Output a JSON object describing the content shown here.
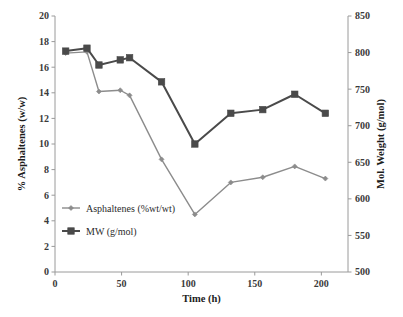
{
  "chart_data": {
    "type": "line",
    "title": "",
    "subtitle": "",
    "xlabel": "Time (h)",
    "ylabel": "% Asphaltenes (w/w)",
    "y2label": "Mol. Weight (g/mol)",
    "xlim": [
      0,
      220
    ],
    "ylim": [
      0,
      20
    ],
    "y2lim": [
      500,
      850
    ],
    "xticks": [
      0,
      50,
      100,
      150,
      200
    ],
    "xtick_labels": [
      "0",
      "50",
      "100",
      "150",
      "200"
    ],
    "yticks": [
      0,
      2,
      4,
      6,
      8,
      10,
      12,
      14,
      16,
      18,
      20
    ],
    "ytick_labels": [
      "0",
      "2",
      "4",
      "6",
      "8",
      "10",
      "12",
      "14",
      "16",
      "18",
      "20"
    ],
    "y2ticks": [
      500,
      550,
      600,
      650,
      700,
      750,
      800,
      850
    ],
    "y2tick_labels": [
      "500",
      "550",
      "600",
      "650",
      "700",
      "750",
      "800",
      "850"
    ],
    "grid": false,
    "legend_position": "inside-lower-left",
    "series": [
      {
        "name": "Asphaltenes (%wt/wt)",
        "axis": "left",
        "color": "#8c8c8c",
        "marker": "diamond",
        "x": [
          8,
          24,
          33,
          49,
          56,
          80,
          105,
          132,
          156,
          180,
          203
        ],
        "values": [
          17.1,
          17.2,
          14.1,
          14.2,
          13.8,
          8.8,
          4.5,
          7.0,
          7.4,
          8.25,
          7.3
        ]
      },
      {
        "name": "MW (g/mol)",
        "axis": "right",
        "color": "#4a4a4a",
        "marker": "square",
        "x": [
          8,
          24,
          33,
          49,
          56,
          80,
          105,
          132,
          156,
          180,
          203
        ],
        "values": [
          802,
          806,
          783,
          790,
          793,
          760,
          675,
          717,
          722,
          743,
          717
        ]
      }
    ]
  },
  "legend": {
    "items": [
      {
        "label": "Asphaltenes (%wt/wt)",
        "color": "#8c8c8c",
        "marker": "diamond"
      },
      {
        "label": "MW (g/mol)",
        "color": "#4a4a4a",
        "marker": "square"
      }
    ]
  }
}
